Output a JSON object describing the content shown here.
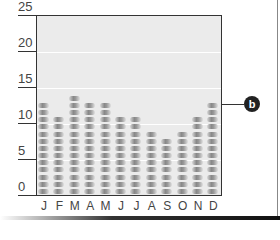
{
  "chart_data": {
    "type": "bar",
    "title": "",
    "xlabel": "",
    "ylabel": "",
    "categories": [
      "J",
      "F",
      "M",
      "A",
      "M",
      "J",
      "J",
      "A",
      "S",
      "O",
      "N",
      "D"
    ],
    "values": [
      13,
      11,
      14,
      13,
      13,
      11,
      11,
      9,
      8,
      9,
      11,
      13
    ],
    "ylim": [
      0,
      25
    ],
    "yticks": [
      "0",
      "5",
      "10",
      "15",
      "20",
      "25"
    ],
    "grid": true,
    "style": "stacked pictogram pills (1 pill = 1 unit)",
    "annotations": [
      {
        "label": "b",
        "target": "D",
        "note": "callout marker"
      }
    ]
  },
  "callout": {
    "label": "b"
  }
}
